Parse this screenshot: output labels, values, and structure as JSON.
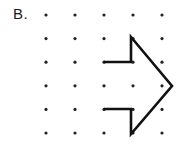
{
  "figure": {
    "label": "B.",
    "background_color": "#ffffff",
    "ink_color": "#111111",
    "dot_color": "#222222",
    "width": 180,
    "height": 148
  },
  "grid": {
    "columns": 5,
    "rows": 6,
    "x_start": 46,
    "y_start": 15,
    "x_spacing": 29,
    "y_spacing": 23.6,
    "dot_radius": 1.6,
    "xs": [
      46,
      75,
      104,
      133,
      162
    ],
    "ys": [
      15,
      38.6,
      62.2,
      85.8,
      109.4,
      133
    ]
  },
  "shape": {
    "name": "right-pointing-arrow",
    "type": "open-polyline",
    "stroke_width": 2.6,
    "points": "104,62 131,62 131,37 172,86 131,134 131,109 104,109",
    "vertices": [
      {
        "name": "tail-top-left",
        "x": 104,
        "y": 62
      },
      {
        "name": "shaft-top-right",
        "x": 131,
        "y": 62
      },
      {
        "name": "barb-top",
        "x": 131,
        "y": 37
      },
      {
        "name": "tip",
        "x": 172,
        "y": 86
      },
      {
        "name": "barb-bottom",
        "x": 131,
        "y": 134
      },
      {
        "name": "shaft-bottom-right",
        "x": 131,
        "y": 109
      },
      {
        "name": "tail-bottom-left",
        "x": 104,
        "y": 109
      }
    ]
  }
}
